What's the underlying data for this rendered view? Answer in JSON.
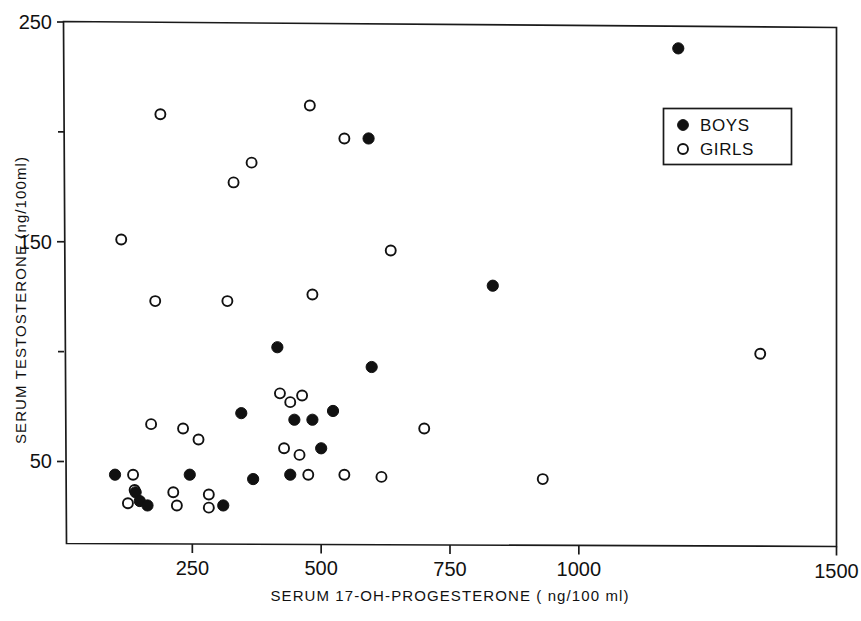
{
  "chart_data": {
    "type": "scatter",
    "title": "",
    "xlabel": "SERUM   17-OH-PROGESTERONE    ( ng/100 ml)",
    "ylabel": "SERUM  TESTOSTERONE   (ng/100ml)",
    "xlim": [
      0,
      1500
    ],
    "ylim": [
      12,
      250
    ],
    "grid": false,
    "xticks": [
      250,
      500,
      750,
      1000,
      1500
    ],
    "xtick_labels": [
      "250",
      "500",
      "750",
      "1000",
      "1500"
    ],
    "yticks": [
      50,
      150,
      250
    ],
    "ytick_labels": [
      "50",
      "150",
      "250"
    ],
    "yticks_minor": [
      100,
      200
    ],
    "legend_position": "upper right",
    "series": [
      {
        "name": "BOYS",
        "marker": "filled-circle",
        "color": "#111111",
        "points": [
          [
            1193,
            238
          ],
          [
            592,
            197
          ],
          [
            833,
            130
          ],
          [
            598,
            93
          ],
          [
            415,
            102
          ],
          [
            345,
            72
          ],
          [
            523,
            73
          ],
          [
            448,
            69
          ],
          [
            483,
            69
          ],
          [
            500,
            56
          ],
          [
            440,
            44
          ],
          [
            368,
            42
          ],
          [
            245,
            44
          ],
          [
            100,
            44
          ],
          [
            140,
            36
          ],
          [
            148,
            32
          ],
          [
            163,
            30
          ],
          [
            310,
            30
          ]
        ]
      },
      {
        "name": "GIRLS",
        "marker": "open-circle",
        "color": "#ffffff",
        "points": [
          [
            478,
            212
          ],
          [
            188,
            208
          ],
          [
            545,
            197
          ],
          [
            365,
            186
          ],
          [
            330,
            177
          ],
          [
            112,
            151
          ],
          [
            635,
            146
          ],
          [
            483,
            126
          ],
          [
            178,
            123
          ],
          [
            318,
            123
          ],
          [
            1352,
            99
          ],
          [
            420,
            81
          ],
          [
            463,
            80
          ],
          [
            440,
            77
          ],
          [
            170,
            67
          ],
          [
            232,
            65
          ],
          [
            700,
            65
          ],
          [
            262,
            60
          ],
          [
            428,
            56
          ],
          [
            458,
            53
          ],
          [
            475,
            44
          ],
          [
            545,
            44
          ],
          [
            617,
            43
          ],
          [
            930,
            42
          ],
          [
            135,
            44
          ],
          [
            138,
            37
          ],
          [
            125,
            31
          ],
          [
            213,
            36
          ],
          [
            220,
            30
          ],
          [
            282,
            35
          ],
          [
            282,
            29
          ]
        ]
      }
    ]
  },
  "legend": {
    "entries": [
      {
        "label": "BOYS",
        "marker": "filled-circle"
      },
      {
        "label": "GIRLS",
        "marker": "open-circle"
      }
    ]
  }
}
